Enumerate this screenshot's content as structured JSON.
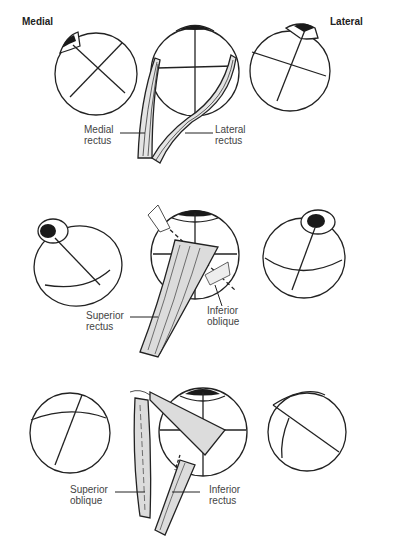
{
  "headers": {
    "left": "Medial",
    "right": "Lateral"
  },
  "rows": [
    {
      "id": "row-1",
      "labels": [
        {
          "line1": "Medial",
          "line2": "rectus"
        },
        {
          "line1": "Lateral",
          "line2": "rectus"
        }
      ]
    },
    {
      "id": "row-2",
      "labels": [
        {
          "line1": "Superior",
          "line2": "rectus"
        },
        {
          "line1": "Inferior",
          "line2": "oblique"
        }
      ]
    },
    {
      "id": "row-3",
      "labels": [
        {
          "line1": "Superior",
          "line2": "oblique"
        },
        {
          "line1": "Inferior",
          "line2": "rectus"
        }
      ]
    }
  ],
  "colors": {
    "line": "#222222",
    "muscle_fill": "#dcdcdc",
    "pupil": "#1a1a1a",
    "text": "#444444"
  }
}
